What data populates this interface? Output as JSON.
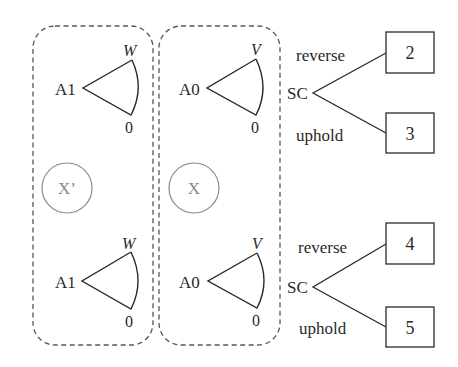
{
  "groups": [
    {
      "id": "left",
      "circle_label": "X’",
      "nodes": [
        {
          "player": "A1",
          "top_label": "W",
          "bottom_label": "0"
        },
        {
          "player": "A1",
          "top_label": "W",
          "bottom_label": "0"
        }
      ]
    },
    {
      "id": "middle",
      "circle_label": "X",
      "nodes": [
        {
          "player": "A0",
          "top_label": "V",
          "bottom_label": "0"
        },
        {
          "player": "A0",
          "top_label": "V",
          "bottom_label": "0"
        }
      ]
    }
  ],
  "trees": [
    {
      "player": "SC",
      "upper_action": "reverse",
      "lower_action": "uphold",
      "upper_outcome": "2",
      "lower_outcome": "3"
    },
    {
      "player": "SC",
      "upper_action": "reverse",
      "lower_action": "uphold",
      "upper_outcome": "4",
      "lower_outcome": "5"
    }
  ],
  "colors": {
    "line": "#2a2a2a",
    "dashed": "#555555",
    "circle": "#8a8a8a"
  }
}
